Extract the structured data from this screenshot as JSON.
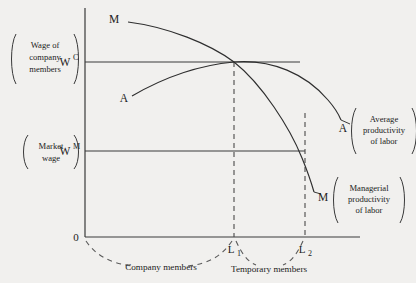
{
  "figure": {
    "background_color": "#f1f0ee",
    "ink_color": "#2a2a2a"
  },
  "axes": {
    "origin_label": "0",
    "y_axis_name": "wage",
    "x_axis_name": "labor"
  },
  "wage_levels": [
    {
      "id": "wc",
      "symbol": "W",
      "superscript": "C",
      "bracket_label_lines": [
        "Wage of",
        "company",
        "members"
      ],
      "y_px": 62
    },
    {
      "id": "wm",
      "symbol": "W",
      "superscript": "M",
      "bracket_label_lines": [
        "Market",
        "wage"
      ],
      "y_px": 151
    }
  ],
  "x_marks": [
    {
      "id": "l1",
      "symbol": "L",
      "subscript": "1",
      "x_px": 234
    },
    {
      "id": "l2",
      "symbol": "L",
      "subscript": "2",
      "x_px": 305
    }
  ],
  "curves": [
    {
      "id": "managerial",
      "start_letter": "M",
      "end_letter": "M",
      "side_label_lines": [
        "Managerial",
        "productivity",
        "of labor"
      ],
      "shape": "downward-sloping"
    },
    {
      "id": "average",
      "start_letter": "A",
      "end_letter": "A",
      "side_label_lines": [
        "Average",
        "productivity",
        "of labor"
      ],
      "shape": "inverted-u"
    }
  ],
  "segments": [
    {
      "id": "company-members",
      "label": "Company members",
      "from_px": 85,
      "to_px": 234
    },
    {
      "id": "temporary-members",
      "label": "Temporary members",
      "from_px": 234,
      "to_px": 305
    }
  ]
}
